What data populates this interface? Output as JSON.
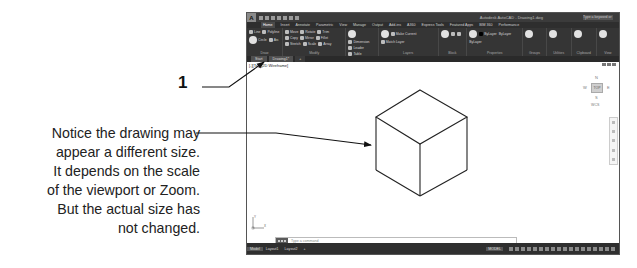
{
  "annotation": {
    "callout_number": "1",
    "note_lines": [
      "Notice the drawing may",
      "appear a different size.",
      "It depends on the scale",
      "of the viewport or Zoom.",
      "But the actual size has",
      "not changed."
    ]
  },
  "window": {
    "app_icon": "A",
    "title": "Autodesk AutoCAD - Drawing1.dwg",
    "search_placeholder": "Type a keyword or phrase",
    "ribbon_tabs": [
      "Home",
      "Insert",
      "Annotate",
      "Parametric",
      "View",
      "Manage",
      "Output",
      "Add-ins",
      "A360",
      "Express Tools",
      "Featured Apps",
      "BIM 360",
      "Performance"
    ],
    "active_tab": "Home",
    "panels": [
      {
        "title": "Draw",
        "tools": [
          "Line",
          "Polyline",
          "Circle",
          "Arc"
        ]
      },
      {
        "title": "Modify",
        "tools": [
          "Move",
          "Rotate",
          "Trim",
          "Copy",
          "Mirror",
          "Fillet",
          "Stretch",
          "Scale",
          "Array"
        ]
      },
      {
        "title": "Annotation",
        "tools": [
          "Text",
          "Dimension",
          "Leader",
          "Table"
        ]
      },
      {
        "title": "Layers",
        "tools": [
          "Layer Properties",
          "Make Current",
          "Match Layer"
        ]
      },
      {
        "title": "Block",
        "tools": [
          "Insert",
          "Create",
          "Edit"
        ]
      },
      {
        "title": "Properties",
        "tools": [
          "Match Properties",
          "ByLayer",
          "ByLayer",
          "ByLayer"
        ]
      },
      {
        "title": "Groups",
        "tools": [
          "Group",
          "Ungroup"
        ]
      },
      {
        "title": "Utilities",
        "tools": [
          "Measure"
        ]
      },
      {
        "title": "Clipboard",
        "tools": [
          "Paste"
        ]
      },
      {
        "title": "View",
        "tools": [
          "Base"
        ]
      }
    ],
    "doc_tabs": [
      "Start",
      "Drawing1*",
      "+"
    ],
    "viewport_label": "[-][Top][2D Wireframe]",
    "viewcube": {
      "n": "N",
      "w": "W",
      "top": "TOP",
      "e": "E",
      "s": "S",
      "wcs": "WCS"
    },
    "ucs": {
      "x": "X",
      "y": "Y"
    },
    "command_placeholder": "Type a command",
    "layout_tabs": [
      "Model",
      "Layout1",
      "Layout2",
      "+"
    ],
    "status_model": "MODEL"
  }
}
